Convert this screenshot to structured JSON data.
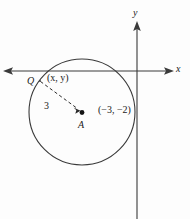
{
  "figure": {
    "type": "coordinate-geometry-diagram",
    "background_color": "#fdfdfd",
    "stroke_color": "#3a3a3a",
    "text_color": "#1a1a1a",
    "axes": {
      "x_label": "x",
      "y_label": "y",
      "x_axis": {
        "y_px": 71,
        "x_start_px": 4,
        "x_end_px": 172,
        "arrows": "both"
      },
      "y_axis": {
        "x_px": 137,
        "y_start_px": 24,
        "y_end_px": 219,
        "arrows": "up"
      }
    },
    "circle": {
      "center_px": {
        "x": 82,
        "y": 112
      },
      "radius_px": 53,
      "center_label": "(−3, −2)",
      "radius_label": "3"
    },
    "points": [
      {
        "name": "Q",
        "label": "Q",
        "x_px": 40,
        "y_px": 81,
        "marker": "none",
        "coord_label": "(x, y)"
      },
      {
        "name": "A",
        "label": "A",
        "x_px": 82,
        "y_px": 112,
        "marker": "filled-dot"
      }
    ],
    "radius_segment": {
      "style": "dashed",
      "from_px": {
        "x": 40,
        "y": 81
      },
      "to_px": {
        "x": 82,
        "y": 112
      },
      "arrowhead": "to-A"
    }
  }
}
